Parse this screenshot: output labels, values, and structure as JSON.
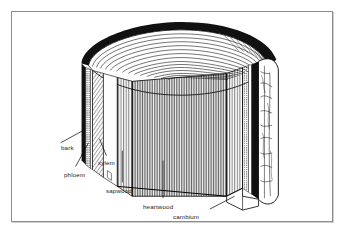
{
  "figure": {
    "style": "black and white line drawing",
    "frame": {
      "border_color": "#8c8c8c",
      "background_color": "#ffffff"
    },
    "ink_color": "#000000",
    "page_background": "#ffffff"
  },
  "labels": {
    "bark": "bark",
    "phloem": "phloem",
    "xylem": "xylem",
    "sapwood": "sapwood",
    "heartwood": "heartwood",
    "cambium": "cambium"
  },
  "callouts": [
    {
      "id": "bark",
      "text": "bark",
      "x": 49,
      "y": 132
    },
    {
      "id": "phloem",
      "text": "phloem",
      "x": 52,
      "y": 159
    },
    {
      "id": "xylem",
      "text": "xylem",
      "x": 86,
      "y": 147
    },
    {
      "id": "sapwood",
      "text": "sapwood",
      "x": 94,
      "y": 175
    },
    {
      "id": "heartwood",
      "text": "heartwood",
      "x": 131,
      "y": 191
    },
    {
      "id": "cambium",
      "text": "cambium",
      "x": 161,
      "y": 201
    }
  ],
  "anatomy_layers": [
    "bark",
    "phloem",
    "cambium",
    "xylem",
    "sapwood",
    "heartwood"
  ]
}
